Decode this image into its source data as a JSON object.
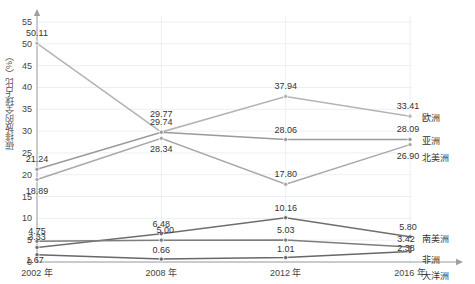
{
  "chart_data": {
    "type": "line",
    "title": "",
    "xlabel": "",
    "ylabel": "碳排放的全球占比（%）",
    "categories": [
      "2002 年",
      "2008 年",
      "2012 年",
      "2016 年"
    ],
    "ylim": [
      0,
      55
    ],
    "ytick_step": 5,
    "yticks": [
      "0",
      "5",
      "10",
      "15",
      "20",
      "25",
      "30",
      "35",
      "40",
      "45",
      "50",
      "55"
    ],
    "grid": true,
    "legend_position": "right",
    "series": [
      {
        "name": "欧洲",
        "color": "#b4b4b4",
        "values": [
          50.11,
          29.77,
          37.94,
          33.41
        ],
        "labels": [
          "50.11",
          "29.77",
          "37.94",
          "33.41"
        ]
      },
      {
        "name": "亚洲",
        "color": "#9a9a9a",
        "values": [
          21.24,
          29.74,
          28.06,
          28.09
        ],
        "labels": [
          "21.24",
          "29.74",
          "28.06",
          "28.09"
        ]
      },
      {
        "name": "北美洲",
        "color": "#a8a8a8",
        "values": [
          18.89,
          28.34,
          17.8,
          26.9
        ],
        "labels": [
          "18.89",
          "28.34",
          "17.80",
          "26.90"
        ]
      },
      {
        "name": "南美洲",
        "color": "#6e6e6e",
        "values": [
          3.33,
          6.48,
          10.16,
          5.8
        ],
        "labels": [
          "3.33",
          "6.48",
          "10.16",
          "5.80"
        ]
      },
      {
        "name": "非洲",
        "color": "#7d7d7d",
        "values": [
          4.75,
          5.0,
          5.03,
          3.42
        ],
        "labels": [
          "4.75",
          "5.00",
          "5.03",
          "3.42"
        ]
      },
      {
        "name": "大洋洲",
        "color": "#686868",
        "values": [
          1.67,
          0.66,
          1.01,
          2.38
        ],
        "labels": [
          "1.67",
          "0.66",
          "1.01",
          "2.38"
        ]
      }
    ]
  },
  "label_offsets": {
    "欧洲": [
      {
        "dx": 0,
        "dy": -9
      },
      {
        "dx": 0,
        "dy": -17
      },
      {
        "dx": 0,
        "dy": -9
      },
      {
        "dx": -2,
        "dy": -9
      }
    ],
    "亚洲": [
      {
        "dx": 0,
        "dy": -9
      },
      {
        "dx": 0,
        "dy": -9
      },
      {
        "dx": 0,
        "dy": -9
      },
      {
        "dx": -2,
        "dy": -9
      }
    ],
    "北美洲": [
      {
        "dx": 0,
        "dy": 12
      },
      {
        "dx": 0,
        "dy": 12
      },
      {
        "dx": 0,
        "dy": -9
      },
      {
        "dx": -2,
        "dy": 12
      }
    ],
    "南美洲": [
      {
        "dx": 0,
        "dy": -9
      },
      {
        "dx": 0,
        "dy": -9
      },
      {
        "dx": 0,
        "dy": -9
      },
      {
        "dx": -2,
        "dy": -9
      }
    ],
    "非洲": [
      {
        "dx": 0,
        "dy": -9
      },
      {
        "dx": 4,
        "dy": -9
      },
      {
        "dx": 0,
        "dy": -9
      },
      {
        "dx": -4,
        "dy": -7
      }
    ],
    "大洋洲": [
      {
        "dx": -2,
        "dy": 6
      },
      {
        "dx": 0,
        "dy": -8
      },
      {
        "dx": 0,
        "dy": -8
      },
      {
        "dx": -4,
        "dy": -3
      }
    ]
  }
}
